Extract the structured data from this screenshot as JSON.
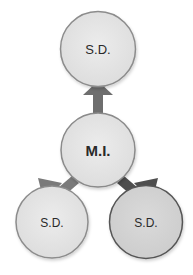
{
  "diagram": {
    "center_node": {
      "label": "M.I.",
      "fill": "#e4e4e4",
      "stroke": "#8a8a8a"
    },
    "nodes": [
      {
        "label": "S.D.",
        "position": "top",
        "fill": "#e6e6e6",
        "stroke": "#8c8c8c",
        "arrow_color": "#6e6e6e"
      },
      {
        "label": "S.D.",
        "position": "bottom-left",
        "fill": "#e6e6e6",
        "stroke": "#8c8c8c",
        "arrow_color": "#7a7a7a"
      },
      {
        "label": "S.D.",
        "position": "bottom-right",
        "fill": "#d6d6d6",
        "stroke": "#555555",
        "arrow_color": "#4e4e4e"
      }
    ]
  }
}
